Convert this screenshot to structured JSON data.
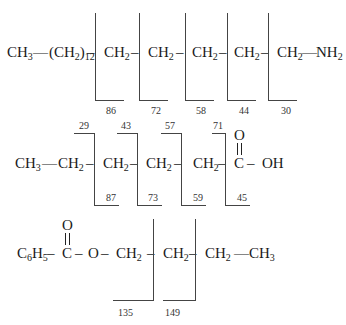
{
  "diagram": {
    "type": "mass-spectrometry-fragmentation",
    "molecules": [
      {
        "id": "amine",
        "segments": [
          "CH3",
          "(CH2)12",
          "CH2",
          "CH2",
          "CH2",
          "CH2",
          "CH2",
          "NH2"
        ],
        "cleavage_labels": [
          "86",
          "72",
          "58",
          "44",
          "30"
        ]
      },
      {
        "id": "acid",
        "segments": [
          "CH3",
          "CH2",
          "CH2",
          "CH2",
          "CH2",
          "C",
          "OH"
        ],
        "carbonyl_O": "O",
        "top_labels": [
          "29",
          "43",
          "57",
          "71"
        ],
        "bottom_labels": [
          "87",
          "73",
          "59",
          "45"
        ]
      },
      {
        "id": "ester",
        "segments": [
          "C6H5",
          "C",
          "O",
          "CH2",
          "CH2",
          "CH2",
          "CH3"
        ],
        "carbonyl_O": "O",
        "cleavage_labels": [
          "135",
          "149"
        ]
      }
    ]
  }
}
